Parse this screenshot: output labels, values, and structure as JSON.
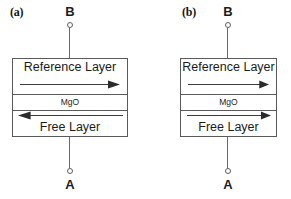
{
  "figure": {
    "line_color": "#5a5a5a",
    "text_color": "#1b1b1b",
    "background": "#ffffff"
  },
  "panels": [
    {
      "id": "a",
      "label": "(a)",
      "terminal_top": {
        "label": "B",
        "dot_icon": "open-circle-terminal-icon"
      },
      "terminal_bottom": {
        "label": "A",
        "dot_icon": "open-circle-terminal-icon"
      },
      "layers": [
        {
          "name": "reference",
          "label": "Reference Layer",
          "arrow_direction": "right",
          "arrow_icon": "arrow-right-icon"
        },
        {
          "name": "barrier",
          "label": "MgO",
          "arrow_direction": "none",
          "arrow_icon": ""
        },
        {
          "name": "free",
          "label": "Free Layer",
          "arrow_direction": "left",
          "arrow_icon": "arrow-left-icon"
        }
      ],
      "state": "antiparallel"
    },
    {
      "id": "b",
      "label": "(b)",
      "terminal_top": {
        "label": "B",
        "dot_icon": "open-circle-terminal-icon"
      },
      "terminal_bottom": {
        "label": "A",
        "dot_icon": "open-circle-terminal-icon"
      },
      "layers": [
        {
          "name": "reference",
          "label": "Reference Layer",
          "arrow_direction": "right",
          "arrow_icon": "arrow-right-icon"
        },
        {
          "name": "barrier",
          "label": "MgO",
          "arrow_direction": "none",
          "arrow_icon": ""
        },
        {
          "name": "free",
          "label": "Free Layer",
          "arrow_direction": "right",
          "arrow_icon": "arrow-right-icon"
        }
      ],
      "state": "parallel"
    }
  ]
}
